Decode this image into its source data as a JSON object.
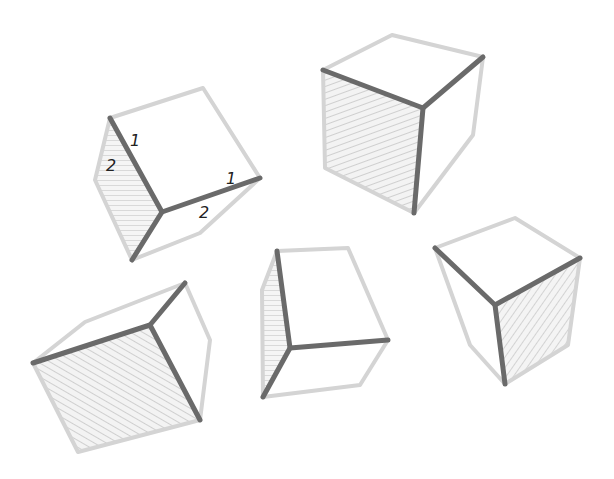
{
  "illustration": {
    "description": "Sketch of five cubes in different orientations with hatched shaded faces and emphasized front corner edges",
    "colors": {
      "background": "#ffffff",
      "light_edge": "#d4d4d4",
      "dark_edge": "#6a6a6a",
      "hatch": "#cfcfcf",
      "label": "#222222"
    },
    "labels": [
      {
        "text": "1",
        "x": 130,
        "y": 146
      },
      {
        "text": "2",
        "x": 106,
        "y": 171
      },
      {
        "text": "1",
        "x": 226,
        "y": 184
      },
      {
        "text": "2",
        "x": 199,
        "y": 218
      }
    ]
  }
}
